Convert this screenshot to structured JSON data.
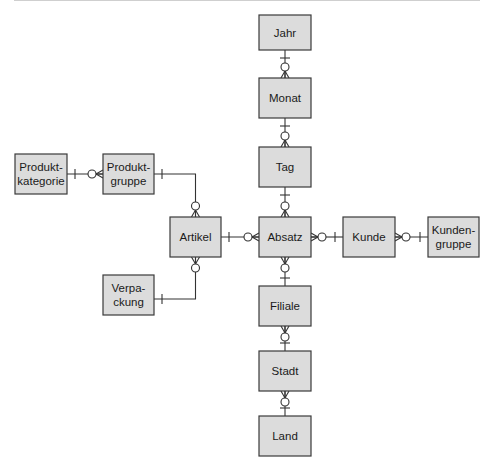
{
  "diagram": {
    "type": "entity-relationship (crow's foot notation)",
    "entities": [
      {
        "id": "jahr",
        "lines": [
          "Jahr"
        ]
      },
      {
        "id": "monat",
        "lines": [
          "Monat"
        ]
      },
      {
        "id": "tag",
        "lines": [
          "Tag"
        ]
      },
      {
        "id": "absatz",
        "lines": [
          "Absatz"
        ]
      },
      {
        "id": "filiale",
        "lines": [
          "Filiale"
        ]
      },
      {
        "id": "stadt",
        "lines": [
          "Stadt"
        ]
      },
      {
        "id": "land",
        "lines": [
          "Land"
        ]
      },
      {
        "id": "artikel",
        "lines": [
          "Artikel"
        ]
      },
      {
        "id": "produktgruppe",
        "lines": [
          "Produkt-",
          "gruppe"
        ]
      },
      {
        "id": "produktkategorie",
        "lines": [
          "Produkt-",
          "kategorie"
        ]
      },
      {
        "id": "verpackung",
        "lines": [
          "Verpa-",
          "ckung"
        ]
      },
      {
        "id": "kunde",
        "lines": [
          "Kunde"
        ]
      },
      {
        "id": "kundengruppe",
        "lines": [
          "Kunden-",
          "gruppe"
        ]
      }
    ],
    "relationships": [
      {
        "one": "jahr",
        "many": "monat"
      },
      {
        "one": "monat",
        "many": "tag"
      },
      {
        "one": "tag",
        "many": "absatz"
      },
      {
        "one": "artikel",
        "many": "absatz"
      },
      {
        "one": "kunde",
        "many": "absatz"
      },
      {
        "one": "filiale",
        "many": "absatz"
      },
      {
        "one": "stadt",
        "many": "filiale"
      },
      {
        "one": "land",
        "many": "stadt"
      },
      {
        "one": "produktgruppe",
        "many": "artikel"
      },
      {
        "one": "produktkategorie",
        "many": "produktgruppe"
      },
      {
        "one": "verpackung",
        "many": "artikel"
      },
      {
        "one": "kundengruppe",
        "many": "kunde"
      }
    ],
    "colors": {
      "entity_fill": "#dcdcdc",
      "stroke": "#333333"
    }
  }
}
